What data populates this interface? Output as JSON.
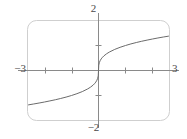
{
  "chart_data": {
    "type": "line",
    "title": "",
    "subtitle": "",
    "xlabel": "",
    "ylabel": "",
    "xlim": [
      -3,
      3
    ],
    "ylim": [
      -2,
      2
    ],
    "grid": false,
    "legend": null,
    "frame": {
      "style": "rounded-rectangle",
      "color": "#cfcfcf",
      "corner_radius": 9
    },
    "axes": {
      "x_axis_label_left": "−3",
      "x_axis_label_right": "3",
      "y_axis_label_top": "2",
      "y_axis_label_bottom": "−2",
      "x_ticks": [
        -2,
        -1,
        1,
        2
      ],
      "y_ticks": [
        -1,
        1
      ],
      "x_tick_labels": [
        "",
        "",
        "",
        ""
      ],
      "y_tick_labels": [
        "",
        ""
      ],
      "axis_color": "#8a8a8a"
    },
    "series": [
      {
        "name": "cube root",
        "color": "#6b6b6b",
        "line_width": 1,
        "x": [
          -3.0,
          -2.8,
          -2.6,
          -2.4,
          -2.2,
          -2.0,
          -1.8,
          -1.6,
          -1.4,
          -1.2,
          -1.0,
          -0.8,
          -0.6,
          -0.4,
          -0.3,
          -0.2,
          -0.15,
          -0.1,
          -0.06,
          -0.03,
          -0.01,
          0.0,
          0.01,
          0.03,
          0.06,
          0.1,
          0.15,
          0.2,
          0.3,
          0.4,
          0.6,
          0.8,
          1.0,
          1.2,
          1.4,
          1.6,
          1.8,
          2.0,
          2.2,
          2.4,
          2.6,
          2.8,
          3.0
        ],
        "y": [
          -1.442,
          -1.409,
          -1.375,
          -1.339,
          -1.301,
          -1.26,
          -1.216,
          -1.17,
          -1.119,
          -1.063,
          -1.0,
          -0.928,
          -0.843,
          -0.737,
          -0.669,
          -0.585,
          -0.531,
          -0.464,
          -0.391,
          -0.311,
          -0.215,
          0.0,
          0.215,
          0.311,
          0.391,
          0.464,
          0.531,
          0.585,
          0.669,
          0.737,
          0.843,
          0.928,
          1.0,
          1.063,
          1.119,
          1.17,
          1.216,
          1.26,
          1.301,
          1.339,
          1.375,
          1.409,
          1.442
        ]
      }
    ]
  },
  "labels": {
    "top": "2",
    "bottom": "−2",
    "left": "−3",
    "right": "3"
  }
}
